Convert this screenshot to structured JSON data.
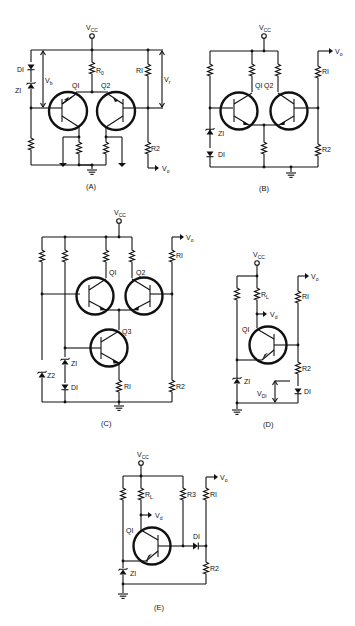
{
  "figure": {
    "panels": [
      {
        "id": "A",
        "caption": "(A)",
        "supply": "V",
        "supply_sub": "CC",
        "components": {
          "d1": "DI",
          "z1": "ZI",
          "q1": "QI",
          "q2": "Q2",
          "r0": "R",
          "r0_sub": "0",
          "r1": "RI",
          "r2": "R2"
        },
        "annotations": {
          "vb": "V",
          "vb_sub": "b",
          "vr": "V",
          "vr_sub": "r",
          "vo": "V",
          "vo_sub": "o"
        }
      },
      {
        "id": "B",
        "caption": "(B)",
        "supply": "V",
        "supply_sub": "CC",
        "components": {
          "z1": "ZI",
          "d1": "DI",
          "q1": "QI",
          "q2": "Q2",
          "r1": "RI",
          "r2": "R2"
        },
        "annotations": {
          "vo": "V",
          "vo_sub": "o"
        }
      },
      {
        "id": "C",
        "caption": "(C)",
        "supply": "V",
        "supply_sub": "CC",
        "components": {
          "q1": "QI",
          "q2": "Q2",
          "q3": "Q3",
          "z1": "ZI",
          "z2": "Z2",
          "d1": "DI",
          "r1": "RI",
          "r1b": "RI",
          "r2": "R2"
        },
        "annotations": {
          "vo": "V",
          "vo_sub": "o"
        }
      },
      {
        "id": "D",
        "caption": "(D)",
        "supply": "V",
        "supply_sub": "CC",
        "components": {
          "rl": "R",
          "rl_sub": "L",
          "q1": "QI",
          "z1": "ZI",
          "r1": "RI",
          "r2": "R2",
          "d1": "DI"
        },
        "annotations": {
          "vd": "V",
          "vd_sub": "d",
          "vo": "V",
          "vo_sub": "o",
          "vd1": "V",
          "vd1_sub": "DI"
        }
      },
      {
        "id": "E",
        "caption": "(E)",
        "supply": "V",
        "supply_sub": "CC",
        "components": {
          "rl": "R",
          "rl_sub": "L",
          "r3": "R3",
          "r1": "RI",
          "r2": "R2",
          "q1": "QI",
          "d1": "DI",
          "z1": "ZI"
        },
        "annotations": {
          "vd": "V",
          "vd_sub": "d",
          "vo": "V",
          "vo_sub": "o"
        }
      }
    ]
  }
}
